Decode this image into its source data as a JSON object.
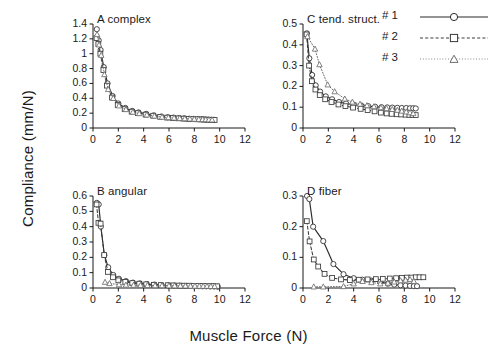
{
  "figure": {
    "xlabel": "Muscle Force (N)",
    "ylabel": "Compliance (mm/N)"
  },
  "legend": {
    "entries": [
      {
        "label": "# 1",
        "style": "solid",
        "marker": "circle"
      },
      {
        "label": "# 2",
        "style": "dashed",
        "marker": "square"
      },
      {
        "label": "# 3",
        "style": "dotted",
        "marker": "triangle"
      }
    ]
  },
  "chart_data": [
    {
      "type": "line",
      "panel": "A",
      "title": "A complex",
      "xlabel": "Muscle Force (N)",
      "ylabel": "Compliance (mm/N)",
      "xlim": [
        0,
        12
      ],
      "ylim": [
        0,
        1.4
      ],
      "xticks": [
        0,
        2,
        4,
        6,
        8,
        10,
        12
      ],
      "yticks": [
        0,
        0.2,
        0.4,
        0.6,
        0.8,
        1,
        1.2,
        1.4
      ],
      "ytick_labels": [
        "0",
        "0.2",
        "0.4",
        "0.6",
        "0.8",
        "1",
        "1.2",
        "1.4"
      ],
      "grid": false,
      "series": [
        {
          "name": "# 1",
          "marker": "circle",
          "style": "solid",
          "x": [
            0.3,
            0.45,
            0.6,
            0.85,
            1.15,
            1.55,
            2.0,
            2.55,
            3.1,
            3.6,
            4.2,
            4.8,
            5.4,
            5.9,
            6.35,
            6.8,
            7.2,
            7.6,
            7.95,
            8.3,
            8.6,
            8.85,
            9.1,
            9.35,
            9.55
          ],
          "y": [
            1.33,
            1.18,
            1.05,
            0.82,
            0.6,
            0.43,
            0.33,
            0.27,
            0.23,
            0.21,
            0.19,
            0.17,
            0.155,
            0.145,
            0.14,
            0.135,
            0.13,
            0.125,
            0.122,
            0.12,
            0.118,
            0.115,
            0.113,
            0.112,
            0.11
          ]
        },
        {
          "name": "# 2",
          "marker": "square",
          "style": "dashed",
          "x": [
            0.28,
            0.42,
            0.58,
            0.82,
            1.1,
            1.5,
            1.95,
            2.5,
            3.05,
            3.55,
            4.15,
            4.75,
            5.3,
            5.85,
            6.3,
            6.75,
            7.15,
            7.55,
            7.9,
            8.25,
            8.55,
            8.8,
            9.05,
            9.3,
            9.6
          ],
          "y": [
            1.21,
            1.13,
            1.0,
            0.78,
            0.57,
            0.41,
            0.31,
            0.255,
            0.22,
            0.2,
            0.18,
            0.165,
            0.15,
            0.14,
            0.135,
            0.13,
            0.126,
            0.122,
            0.119,
            0.117,
            0.115,
            0.113,
            0.111,
            0.11,
            0.108
          ]
        },
        {
          "name": "# 3",
          "marker": "triangle",
          "style": "dotted",
          "x": [
            0.32,
            0.48,
            0.65,
            0.9,
            1.2,
            1.6,
            2.05,
            2.6,
            3.15,
            3.65,
            4.25,
            4.85,
            5.45,
            5.95,
            6.4,
            6.85,
            7.25,
            7.65,
            8.0,
            8.35,
            8.65,
            8.9,
            9.15,
            9.4
          ],
          "y": [
            1.26,
            1.12,
            0.98,
            0.72,
            0.52,
            0.4,
            0.3,
            0.25,
            0.215,
            0.195,
            0.178,
            0.162,
            0.148,
            0.142,
            0.136,
            0.131,
            0.127,
            0.123,
            0.12,
            0.118,
            0.116,
            0.114,
            0.112,
            0.11
          ]
        }
      ]
    },
    {
      "type": "line",
      "panel": "B",
      "title": "B angular",
      "xlabel": "Muscle Force (N)",
      "ylabel": "Compliance (mm/N)",
      "xlim": [
        0,
        12
      ],
      "ylim": [
        0,
        0.6
      ],
      "xticks": [
        0,
        2,
        4,
        6,
        8,
        10,
        12
      ],
      "yticks": [
        0,
        0.1,
        0.2,
        0.3,
        0.4,
        0.5,
        0.6
      ],
      "ytick_labels": [
        "0",
        "0.1",
        "0.2",
        "0.3",
        "0.4",
        "0.5",
        "0.6"
      ],
      "grid": false,
      "series": [
        {
          "name": "# 1",
          "marker": "circle",
          "style": "solid",
          "x": [
            0.3,
            0.45,
            0.62,
            0.9,
            1.2,
            1.6,
            2.05,
            2.6,
            3.15,
            3.7,
            4.25,
            4.85,
            5.4,
            5.95,
            6.4,
            6.85,
            7.25,
            7.65,
            8.0,
            8.35,
            8.65,
            8.95,
            9.25,
            9.55,
            9.85
          ],
          "y": [
            0.555,
            0.545,
            0.4,
            0.215,
            0.135,
            0.085,
            0.06,
            0.045,
            0.035,
            0.03,
            0.025,
            0.022,
            0.019,
            0.017,
            0.016,
            0.015,
            0.014,
            0.013,
            0.012,
            0.012,
            0.011,
            0.011,
            0.01,
            0.01,
            0.009
          ]
        },
        {
          "name": "# 2",
          "marker": "square",
          "style": "dashed",
          "x": [
            0.28,
            0.43,
            0.6,
            0.88,
            1.18,
            1.58,
            2.0,
            2.55,
            3.1,
            3.65,
            4.2,
            4.8,
            5.35,
            5.9,
            6.35,
            6.8,
            7.2,
            7.6,
            7.95,
            8.3,
            8.6,
            8.9,
            9.2,
            9.5,
            9.8
          ],
          "y": [
            0.545,
            0.425,
            0.42,
            0.215,
            0.105,
            0.07,
            0.05,
            0.04,
            0.032,
            0.028,
            0.024,
            0.021,
            0.019,
            0.018,
            0.017,
            0.016,
            0.015,
            0.015,
            0.014,
            0.014,
            0.013,
            0.013,
            0.012,
            0.012,
            0.011
          ]
        },
        {
          "name": "# 3",
          "marker": "triangle",
          "style": "dotted",
          "x": [
            0.95,
            1.3,
            2.05,
            2.6,
            3.2,
            3.75,
            4.3,
            4.9,
            5.45,
            6.0,
            6.45,
            6.9,
            7.3,
            7.7,
            8.05,
            8.4,
            8.7,
            9.0,
            9.3,
            9.6
          ],
          "y": [
            0.038,
            0.03,
            0.022,
            0.02,
            0.019,
            0.018,
            0.017,
            0.016,
            0.016,
            0.015,
            0.015,
            0.014,
            0.014,
            0.013,
            0.013,
            0.012,
            0.012,
            0.012,
            0.011,
            0.011
          ]
        }
      ]
    },
    {
      "type": "line",
      "panel": "C",
      "title": "C tend. struct.",
      "xlabel": "Muscle Force (N)",
      "ylabel": "Compliance (mm/N)",
      "xlim": [
        0,
        12
      ],
      "ylim": [
        0,
        0.5
      ],
      "xticks": [
        0,
        2,
        4,
        6,
        8,
        10,
        12
      ],
      "yticks": [
        0,
        0.1,
        0.2,
        0.3,
        0.4,
        0.5
      ],
      "ytick_labels": [
        "0",
        "0.1",
        "0.2",
        "0.3",
        "0.4",
        "0.5"
      ],
      "grid": false,
      "series": [
        {
          "name": "# 1",
          "marker": "circle",
          "style": "solid",
          "x": [
            0.3,
            0.5,
            0.72,
            1.0,
            1.35,
            1.8,
            2.3,
            2.85,
            3.4,
            4.0,
            4.6,
            5.15,
            5.7,
            6.2,
            6.65,
            7.05,
            7.45,
            7.8,
            8.15,
            8.45,
            8.7,
            8.9
          ],
          "y": [
            0.455,
            0.335,
            0.255,
            0.205,
            0.175,
            0.152,
            0.138,
            0.125,
            0.118,
            0.112,
            0.108,
            0.105,
            0.102,
            0.1,
            0.099,
            0.098,
            0.097,
            0.096,
            0.096,
            0.095,
            0.095,
            0.094
          ]
        },
        {
          "name": "# 2",
          "marker": "square",
          "style": "dashed",
          "x": [
            0.28,
            0.48,
            0.7,
            0.98,
            1.32,
            1.75,
            2.25,
            2.8,
            3.35,
            3.95,
            4.55,
            5.1,
            5.65,
            6.15,
            6.6,
            7.0,
            7.4,
            7.75,
            8.1,
            8.4,
            8.65,
            8.9
          ],
          "y": [
            0.45,
            0.3,
            0.225,
            0.185,
            0.158,
            0.138,
            0.125,
            0.113,
            0.105,
            0.098,
            0.092,
            0.086,
            0.08,
            0.074,
            0.07,
            0.068,
            0.066,
            0.065,
            0.064,
            0.063,
            0.063,
            0.062
          ]
        },
        {
          "name": "# 3",
          "marker": "triangle",
          "style": "dotted",
          "x": [
            0.35,
            0.95,
            1.3,
            1.95,
            2.5,
            3.3,
            3.9,
            4.5,
            5.05,
            5.6,
            6.15,
            6.6,
            7.05,
            7.45,
            7.8,
            8.15,
            8.45,
            8.7
          ],
          "y": [
            0.44,
            0.38,
            0.305,
            0.208,
            0.175,
            0.14,
            0.125,
            0.115,
            0.108,
            0.103,
            0.098,
            0.094,
            0.09,
            0.086,
            0.082,
            0.078,
            0.074,
            0.07
          ]
        }
      ]
    },
    {
      "type": "line",
      "panel": "D",
      "title": "D fiber",
      "xlabel": "Muscle Force (N)",
      "ylabel": "Compliance (mm/N)",
      "xlim": [
        0,
        12
      ],
      "ylim": [
        0,
        0.3
      ],
      "xticks": [
        0,
        2,
        4,
        6,
        8,
        10,
        12
      ],
      "yticks": [
        0,
        0.1,
        0.2,
        0.3
      ],
      "ytick_labels": [
        "0",
        "0.1",
        "0.2",
        "0.3"
      ],
      "grid": false,
      "series": [
        {
          "name": "# 1",
          "marker": "circle",
          "style": "solid",
          "x": [
            0.32,
            0.5,
            0.8,
            1.6,
            2.4,
            3.2,
            4.0,
            4.7,
            5.4,
            6.1,
            6.7,
            7.2,
            7.7,
            8.1,
            8.45,
            8.75,
            9.0
          ],
          "y": [
            0.3,
            0.29,
            0.2,
            0.153,
            0.078,
            0.045,
            0.032,
            0.027,
            0.024,
            0.02,
            0.014,
            0.011,
            0.009,
            0.008,
            0.007,
            0.006,
            0.006
          ]
        },
        {
          "name": "# 2",
          "marker": "square",
          "style": "dashed",
          "x": [
            0.3,
            0.52,
            0.85,
            1.2,
            1.7,
            2.3,
            3.0,
            3.7,
            4.4,
            5.1,
            5.75,
            6.3,
            6.85,
            7.35,
            7.8,
            8.2,
            8.55,
            8.9,
            9.2,
            9.5
          ],
          "y": [
            0.218,
            0.152,
            0.093,
            0.07,
            0.046,
            0.033,
            0.028,
            0.026,
            0.027,
            0.028,
            0.029,
            0.03,
            0.031,
            0.032,
            0.033,
            0.034,
            0.034,
            0.035,
            0.035,
            0.035
          ]
        },
        {
          "name": "# 3",
          "marker": "triangle",
          "style": "dotted",
          "x": [
            0.85,
            1.6,
            3.2,
            4.0,
            4.7,
            5.4,
            6.1,
            6.7,
            7.2,
            7.7,
            8.1,
            8.45,
            8.75
          ],
          "y": [
            0.004,
            0.004,
            0.005,
            0.014,
            0.022,
            0.018,
            0.014,
            0.016,
            0.02,
            0.024,
            0.026,
            0.028,
            0.022
          ]
        }
      ]
    }
  ],
  "colors": {
    "axis": "#1a1a1a",
    "series1": "#2b2b2b",
    "series2": "#3a3a3a",
    "series3": "#6e6e6e",
    "background": "#ffffff"
  }
}
